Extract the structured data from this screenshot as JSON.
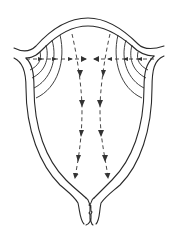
{
  "diagram": {
    "colors": {
      "line": "#2a2a2a",
      "background": "#ffffff"
    },
    "parts": [
      {
        "name": "fundus",
        "label": ""
      },
      {
        "name": "left-cornu",
        "label": ""
      },
      {
        "name": "right-cornu",
        "label": ""
      },
      {
        "name": "uterine-wall",
        "label": ""
      },
      {
        "name": "cervix",
        "label": ""
      }
    ],
    "arrows": {
      "horizontal": {
        "count": 2,
        "direction": "from cornua toward midline",
        "y": 58
      },
      "vertical": {
        "count": 2,
        "direction": "from fundus downward toward cervix"
      }
    },
    "concentric_arcs": {
      "left": 4,
      "right": 4
    }
  }
}
